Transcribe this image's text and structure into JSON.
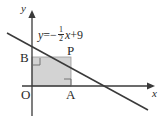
{
  "figure": {
    "width": 163,
    "height": 130,
    "background": "#ffffff",
    "stroke_color": "#3a3a3a",
    "fill_color": "#d3d3d3",
    "text_color": "#2a2a2a"
  },
  "axes": {
    "x_label": "x",
    "y_label": "y",
    "origin_label": "O",
    "x_axis": {
      "x1": 22,
      "y1": 86,
      "x2": 152,
      "y2": 86
    },
    "y_axis": {
      "x1": 32,
      "y1": 116,
      "x2": 32,
      "y2": 12
    }
  },
  "line": {
    "equation_parts": {
      "y": "y",
      "equals": "=",
      "minus": "−",
      "numerator": "1",
      "denominator": "2",
      "x": "x",
      "plus": "+",
      "constant": "9"
    },
    "equation_text": "y = -1/2 x + 9",
    "slope": -0.5,
    "intercept": 9,
    "x1": 7,
    "y1": 33,
    "x2": 148,
    "y2": 110
  },
  "rectangle": {
    "name": "OAPB",
    "x": 32,
    "y": 57,
    "width": 39,
    "height": 29,
    "fill": "#d3d3d3"
  },
  "points": [
    {
      "id": "origin",
      "label": "O",
      "x": 32,
      "y": 86,
      "label_x": 21,
      "label_y": 88
    },
    {
      "id": "a",
      "label": "A",
      "x": 71,
      "y": 86,
      "label_x": 66,
      "label_y": 88
    },
    {
      "id": "p",
      "label": "P",
      "x": 71,
      "y": 57,
      "label_x": 67,
      "label_y": 45
    },
    {
      "id": "b",
      "label": "B",
      "x": 32,
      "y": 57,
      "label_x": 20,
      "label_y": 51
    }
  ],
  "right_angle_marks": [
    {
      "id": "mark-at-b",
      "x": 33,
      "y": 58,
      "size": 7
    },
    {
      "id": "mark-at-a",
      "x": 64,
      "y": 79,
      "size": 7
    }
  ]
}
